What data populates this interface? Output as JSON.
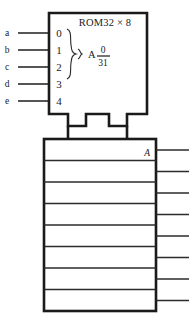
{
  "diagram": {
    "type": "rom-block-diagram",
    "background_color": "#ffffff",
    "line_color": "#1a1a1a",
    "rom": {
      "title": "ROM32 × 8",
      "address_label": "A",
      "address_range_top": "0",
      "address_range_bottom": "31",
      "address_pin_labels": [
        "0",
        "1",
        "2",
        "3",
        "4"
      ],
      "brace_glyph": "right-curly-brace",
      "pointer_glyph": "small-right-brace"
    },
    "inputs": [
      {
        "label": "a",
        "pin": "0"
      },
      {
        "label": "b",
        "pin": "1"
      },
      {
        "label": "c",
        "pin": "2"
      },
      {
        "label": "d",
        "pin": "3"
      },
      {
        "label": "e",
        "pin": "4"
      }
    ],
    "output_block": {
      "label": "A",
      "row_count": 8,
      "rows": [
        "",
        "",
        "",
        "",
        "",
        "",
        "",
        ""
      ],
      "output_line_count": 8
    },
    "bus_legs": 2
  }
}
